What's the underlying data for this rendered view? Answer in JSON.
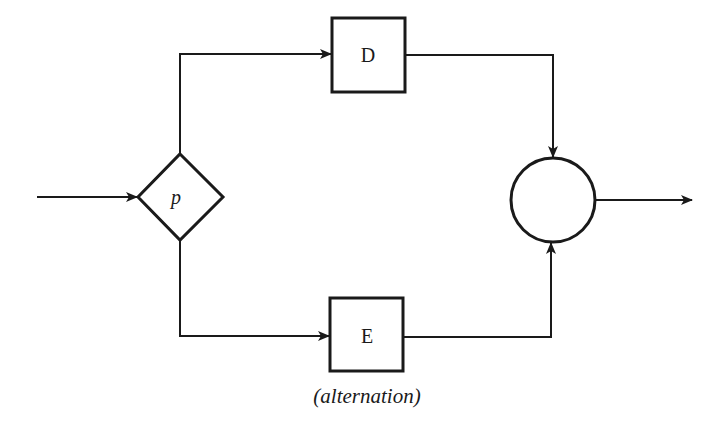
{
  "diagram": {
    "type": "flowchart",
    "caption": "(alternation)",
    "nodes": {
      "decision": {
        "shape": "diamond",
        "label": "p"
      },
      "box_top": {
        "shape": "rectangle",
        "label": "D"
      },
      "box_bottom": {
        "shape": "rectangle",
        "label": "E"
      },
      "junction": {
        "shape": "circle",
        "label": ""
      }
    },
    "edges": [
      {
        "from": "input",
        "to": "decision"
      },
      {
        "from": "decision",
        "to": "box_top"
      },
      {
        "from": "decision",
        "to": "box_bottom"
      },
      {
        "from": "box_top",
        "to": "junction"
      },
      {
        "from": "box_bottom",
        "to": "junction"
      },
      {
        "from": "junction",
        "to": "output"
      }
    ],
    "colors": {
      "stroke": "#1a1a1a",
      "background": "#ffffff"
    }
  }
}
